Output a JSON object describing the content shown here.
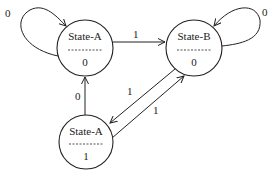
{
  "diagram": {
    "type": "state-machine",
    "nodes": [
      {
        "id": "n1",
        "name": "State-A",
        "output": "0",
        "separator": "----------"
      },
      {
        "id": "n2",
        "name": "State-B",
        "output": "0",
        "separator": "----------"
      },
      {
        "id": "n3",
        "name": "State-A",
        "output": "1",
        "separator": "----------"
      }
    ],
    "edges": [
      {
        "from": "n1",
        "to": "n1",
        "label": "0"
      },
      {
        "from": "n1",
        "to": "n2",
        "label": "1"
      },
      {
        "from": "n2",
        "to": "n2",
        "label": "0"
      },
      {
        "from": "n2",
        "to": "n3",
        "label": "1"
      },
      {
        "from": "n3",
        "to": "n2",
        "label": "1"
      },
      {
        "from": "n3",
        "to": "n1",
        "label": "0"
      }
    ]
  }
}
